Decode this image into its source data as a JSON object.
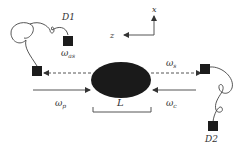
{
  "diagram": {
    "type": "optical-setup-schematic",
    "labels": {
      "detector1": "D1",
      "detector2": "D2",
      "omega_as": "ω",
      "omega_as_sub": "as",
      "omega_s": "ω",
      "omega_s_sub": "s",
      "omega_p": "ω",
      "omega_p_sub": "p",
      "omega_c": "ω",
      "omega_c_sub": "c",
      "length": "L",
      "axis_z": "z",
      "axis_x": "x"
    },
    "colors": {
      "medium": "#1a1a1a",
      "line": "#555555",
      "detector": "#1c1c1c",
      "text": "#333333"
    }
  }
}
